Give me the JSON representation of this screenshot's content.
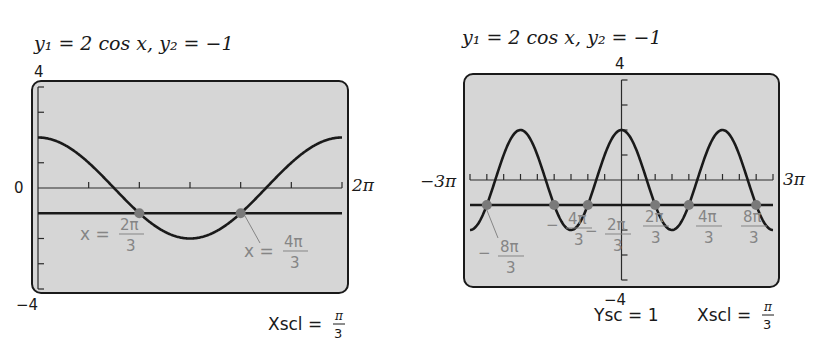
{
  "chart_data": [
    {
      "type": "line",
      "title": "y₁ = 2 cos x,   y₂ = −1",
      "series": [
        {
          "name": "y1",
          "expression": "2 cos x"
        },
        {
          "name": "y2",
          "expression": "-1",
          "value": -1
        }
      ],
      "xlim": [
        0,
        6.2832
      ],
      "xlim_labels": [
        "",
        "2π"
      ],
      "ylim": [
        -4,
        4
      ],
      "ylim_labels": {
        "top": "4",
        "bottom": "−4",
        "origin": "0"
      },
      "xscl": 1.0472,
      "yscl": 1,
      "intersections": [
        {
          "x": 2.0944,
          "y": -1,
          "label_lhs": "x =",
          "num": "2π",
          "den": "3"
        },
        {
          "x": 4.1888,
          "y": -1,
          "label_lhs": "x =",
          "num": "4π",
          "den": "3"
        }
      ],
      "footer": {
        "text": "Xscl =",
        "num": "π",
        "den": "3"
      }
    },
    {
      "type": "line",
      "title": "y₁ = 2 cos x,   y₂ = −1",
      "series": [
        {
          "name": "y1",
          "expression": "2 cos x"
        },
        {
          "name": "y2",
          "expression": "-1",
          "value": -1
        }
      ],
      "xlim": [
        -9.4248,
        9.4248
      ],
      "xlim_labels": [
        "−3π",
        "3π"
      ],
      "ylim": [
        -4,
        4
      ],
      "ylim_labels": {
        "top": "4",
        "bottom": "−4"
      },
      "xscl": 1.0472,
      "yscl": 1,
      "intersections": [
        {
          "x": -8.3776,
          "y": -1,
          "sign": "−",
          "num": "8π",
          "den": "3"
        },
        {
          "x": -4.1888,
          "y": -1,
          "sign": "−",
          "num": "4π",
          "den": "3"
        },
        {
          "x": -2.0944,
          "y": -1,
          "sign": "−",
          "num": "2π",
          "den": "3"
        },
        {
          "x": 2.0944,
          "y": -1,
          "sign": "",
          "num": "2π",
          "den": "3"
        },
        {
          "x": 4.1888,
          "y": -1,
          "sign": "",
          "num": "4π",
          "den": "3"
        },
        {
          "x": 8.3776,
          "y": -1,
          "sign": "",
          "num": "8π",
          "den": "3"
        }
      ],
      "footer": {
        "ysc_text": "Ysc = 1",
        "text": "Xscl =",
        "num": "π",
        "den": "3"
      }
    }
  ],
  "colors": {
    "screen": "#d6d6d6",
    "curve": "#1a1a1a",
    "point": "#7a7a7a",
    "annotation": "#858585"
  }
}
